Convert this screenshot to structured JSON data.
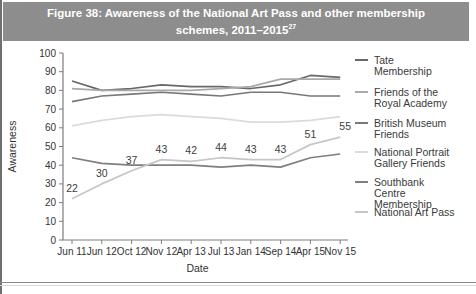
{
  "figure_title": {
    "line1": "Figure 38: Awareness of the National Art Pass and other membership",
    "line2_text": "schemes, 2011–2015",
    "line2_superscript": "27"
  },
  "colors": {
    "title_bar_bg": "#8d8d8d",
    "title_bar_text": "#ffffff",
    "axis": "#7d7d7d",
    "tick_text": "#333333"
  },
  "chart_data": {
    "type": "line",
    "title": "Figure 38: Awareness of the National Art Pass and other membership schemes, 2011–2015",
    "xlabel": "Date",
    "ylabel": "Awareness",
    "ylim": [
      0,
      100
    ],
    "yticks": [
      0,
      10,
      20,
      30,
      40,
      50,
      60,
      70,
      80,
      90,
      100
    ],
    "grid": false,
    "legend_position": "right",
    "categories": [
      "Jun 11",
      "Jun 12",
      "Oct 12",
      "Nov 12",
      "Apr 13",
      "Jul 13",
      "Jan 14",
      "Sep 14",
      "Apr 15",
      "Nov 15"
    ],
    "series": [
      {
        "name": "Tate Membership",
        "color": "#686868",
        "values": [
          85,
          80,
          81,
          83,
          82,
          82,
          81,
          83,
          88,
          87
        ],
        "data_labels": false
      },
      {
        "name": "Friends of the Royal Academy",
        "color": "#a9a9a9",
        "values": [
          81,
          80,
          80,
          80,
          80,
          81,
          82,
          86,
          86,
          86
        ],
        "data_labels": false
      },
      {
        "name": "British Museum Friends",
        "color": "#787878",
        "values": [
          74,
          77,
          78,
          79,
          78,
          77,
          79,
          79,
          77,
          77
        ],
        "data_labels": false
      },
      {
        "name": "National Portrait Gallery Friends",
        "color": "#dbdbdb",
        "values": [
          61,
          64,
          66,
          67,
          66,
          65,
          63,
          63,
          64,
          66
        ],
        "data_labels": false
      },
      {
        "name": "Southbank Centre Membership",
        "color": "#7f7f7f",
        "values": [
          44,
          41,
          40,
          40,
          40,
          39,
          40,
          39,
          44,
          46
        ],
        "data_labels": false
      },
      {
        "name": "National Art Pass",
        "color": "#c6c6c6",
        "values": [
          22,
          30,
          37,
          43,
          42,
          44,
          43,
          43,
          51,
          55
        ],
        "data_labels": true
      }
    ]
  },
  "legend": {
    "items": [
      {
        "name": "Tate Membership",
        "lines": "Tate\nMembership",
        "color": "#686868"
      },
      {
        "name": "Friends of the Royal Academy",
        "lines": "Friends of the\nRoyal Academy",
        "color": "#a9a9a9"
      },
      {
        "name": "British Museum Friends",
        "lines": "British Museum\nFriends",
        "color": "#787878"
      },
      {
        "name": "National Portrait Gallery Friends",
        "lines": "National Portrait\nGallery Friends",
        "color": "#dbdbdb"
      },
      {
        "name": "Southbank Centre Membership",
        "lines": "Southbank\nCentre\nMembership",
        "color": "#7f7f7f"
      },
      {
        "name": "National Art Pass",
        "lines": "National Art Pass",
        "color": "#c6c6c6"
      }
    ]
  }
}
